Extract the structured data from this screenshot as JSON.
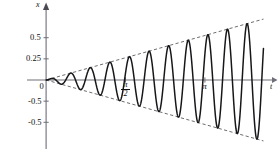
{
  "figure": {
    "kind": "resonance-plot",
    "yaxis_label": "x",
    "xaxis_label": "t"
  },
  "chart_data": {
    "type": "line",
    "title": "",
    "xlabel": "t",
    "ylabel": "x",
    "grid": false,
    "legend": null,
    "xlim": [
      -0.18,
      4.35
    ],
    "ylim": [
      -0.78,
      0.78
    ],
    "y_ticks": [
      {
        "value": 0.5,
        "label": "0.5"
      },
      {
        "value": 0.25,
        "label": "0.25"
      },
      {
        "value": 0.0,
        "label": "0"
      },
      {
        "value": -0.25,
        "label": "-0.5"
      },
      {
        "value": -0.5,
        "label": "-0.5"
      }
    ],
    "x_ticks": [
      {
        "value": 1.5708,
        "label_num": "π",
        "label_den": "2",
        "kind": "fraction"
      },
      {
        "value": 3.1416,
        "label_num": "π",
        "label_den": "",
        "kind": "plain"
      }
    ],
    "series": [
      {
        "name": "x(t)",
        "style": "solid",
        "color": "#1a1a1a",
        "envelope_slope": 0.1675,
        "angular_frequency": 16.2,
        "phase": 0,
        "samples_note": "x(t) = 0.1675 * t * sin(16.2 t)"
      },
      {
        "name": "upper-envelope",
        "style": "dashed",
        "color": "#444444",
        "points": [
          [
            0,
            0
          ],
          [
            4.3,
            0.72
          ]
        ]
      },
      {
        "name": "lower-envelope",
        "style": "dashed",
        "color": "#444444",
        "points": [
          [
            0,
            0
          ],
          [
            4.3,
            -0.72
          ]
        ]
      }
    ],
    "peaks": [
      {
        "t": 0.29,
        "x": 0.049
      },
      {
        "t": 0.68,
        "x": 0.114
      },
      {
        "t": 1.07,
        "x": 0.179
      },
      {
        "t": 1.45,
        "x": 0.243
      },
      {
        "t": 1.84,
        "x": 0.308
      },
      {
        "t": 2.23,
        "x": 0.373
      },
      {
        "t": 2.62,
        "x": 0.439
      },
      {
        "t": 3.01,
        "x": 0.504
      },
      {
        "t": 3.4,
        "x": 0.569
      },
      {
        "t": 3.78,
        "x": 0.633
      },
      {
        "t": 4.17,
        "x": 0.698
      }
    ],
    "troughs": [
      {
        "t": 0.1,
        "x": -0.016
      },
      {
        "t": 0.48,
        "x": -0.081
      },
      {
        "t": 0.87,
        "x": -0.146
      },
      {
        "t": 1.26,
        "x": -0.211
      },
      {
        "t": 1.65,
        "x": -0.276
      },
      {
        "t": 2.04,
        "x": -0.341
      },
      {
        "t": 2.42,
        "x": -0.406
      },
      {
        "t": 2.81,
        "x": -0.471
      },
      {
        "t": 3.2,
        "x": -0.536
      },
      {
        "t": 3.59,
        "x": -0.601
      },
      {
        "t": 3.98,
        "x": -0.666
      }
    ]
  }
}
